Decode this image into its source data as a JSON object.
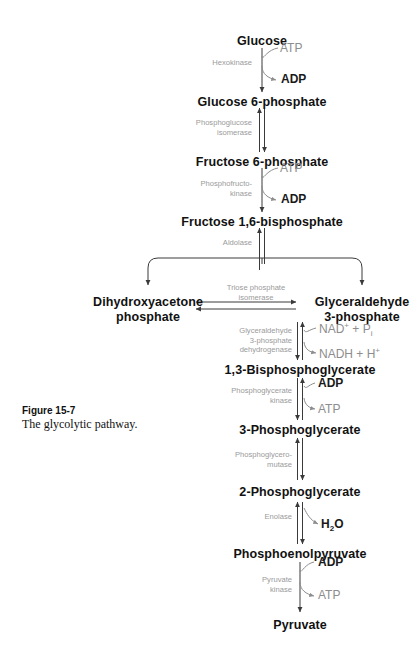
{
  "figure": {
    "label": "Figure 15-7",
    "caption": "The glycolytic pathway."
  },
  "colors": {
    "metabolite_text": "#111111",
    "enzyme_text": "#9a9a9a",
    "cofactor_text": "#8d8d8d",
    "cofactor_dark": "#1a1a1a",
    "arrow": "#3a3a3a",
    "background": "#ffffff"
  },
  "metabolites": [
    {
      "id": "glucose",
      "name": "Glucose"
    },
    {
      "id": "g6p",
      "name": "Glucose 6-phosphate"
    },
    {
      "id": "f6p",
      "name": "Fructose 6-phosphate"
    },
    {
      "id": "f16bp",
      "name": "Fructose 1,6-bisphosphate"
    },
    {
      "id": "dhap_line1",
      "name": "Dihydroxyacetone"
    },
    {
      "id": "dhap_line2",
      "name": "phosphate"
    },
    {
      "id": "g3p_line1",
      "name": "Glyceraldehyde"
    },
    {
      "id": "g3p_line2",
      "name": "3-phosphate"
    },
    {
      "id": "bpg",
      "name": "1,3-Bisphosphoglycerate"
    },
    {
      "id": "pg3",
      "name": "3-Phosphoglycerate"
    },
    {
      "id": "pg2",
      "name": "2-Phosphoglycerate"
    },
    {
      "id": "pep",
      "name": "Phosphoenolpyruvate"
    },
    {
      "id": "pyruvate",
      "name": "Pyruvate"
    }
  ],
  "enzymes": [
    {
      "id": "hexokinase",
      "lines": [
        "Hexokinase"
      ]
    },
    {
      "id": "phosphoglucose_isomerase",
      "lines": [
        "Phosphoglucose",
        "isomerase"
      ]
    },
    {
      "id": "phosphofructokinase",
      "lines": [
        "Phosphofructo-",
        "kinase"
      ]
    },
    {
      "id": "aldolase",
      "lines": [
        "Aldolase"
      ]
    },
    {
      "id": "triose_phosphate_isomerase",
      "lines": [
        "Triose phosphate",
        "isomerase"
      ]
    },
    {
      "id": "gapdh",
      "lines": [
        "Glyceraldehyde",
        "3-phosphate",
        "dehydrogenase"
      ]
    },
    {
      "id": "phosphoglycerate_kinase",
      "lines": [
        "Phosphoglycerate",
        "kinase"
      ]
    },
    {
      "id": "phosphoglyceromutase",
      "lines": [
        "Phosphoglycero-",
        "mutase"
      ]
    },
    {
      "id": "enolase",
      "lines": [
        "Enolase"
      ]
    },
    {
      "id": "pyruvate_kinase",
      "lines": [
        "Pyruvate",
        "kinase"
      ]
    }
  ],
  "cofactors": {
    "hexokinase_in": "ATP",
    "hexokinase_out": "ADP",
    "pfk_in": "ATP",
    "pfk_out": "ADP",
    "gapdh_in_nad": "NAD",
    "gapdh_in_nad_charge": "+",
    "gapdh_in_plus": " + ",
    "gapdh_in_pi": "P",
    "gapdh_in_pi_sub": "i",
    "gapdh_out_nadh": "NADH + H",
    "gapdh_out_charge": "+",
    "pgk_in": "ADP",
    "pgk_out": "ATP",
    "enolase_out_h2o": "H",
    "enolase_out_h2o_sub": "2",
    "enolase_out_h2o_tail": "O",
    "pk_in": "ADP",
    "pk_out": "ATP"
  }
}
